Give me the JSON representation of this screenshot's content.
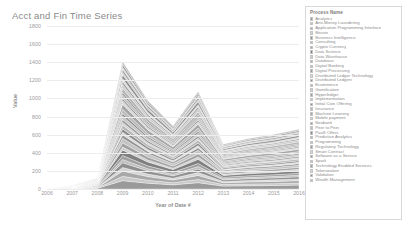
{
  "chart_data": {
    "type": "area",
    "title": "Acct and Fin Time Series",
    "xlabel": "Year of Date #",
    "ylabel": "Value",
    "ylim": [
      0,
      1800
    ],
    "yticks": [
      0,
      200,
      400,
      600,
      800,
      1000,
      1200,
      1400,
      1600,
      1800
    ],
    "ytick_labels": [
      "0",
      "200",
      "400",
      "600",
      "800",
      "1000",
      "1200",
      "1400",
      "1600",
      "1800"
    ],
    "grid": true,
    "legend_position": "right",
    "legend_title": "Process Name",
    "stacked": true,
    "x": [
      2006,
      2007,
      2008,
      2009,
      2010,
      2011,
      2012,
      2013,
      2014,
      2015,
      2016
    ],
    "xtick_labels": [
      "2006",
      "2007",
      "2008",
      "2009",
      "2010",
      "2011",
      "2012",
      "2013",
      "2014",
      "2015",
      "2016"
    ],
    "totals": [
      5,
      40,
      150,
      1790,
      1240,
      880,
      1360,
      620,
      700,
      760,
      840
    ],
    "series": [
      {
        "name": "Analytics",
        "color": "#9a9a9a",
        "values": [
          0,
          2,
          8,
          92,
          64,
          46,
          70,
          32,
          36,
          39,
          43
        ]
      },
      {
        "name": "Anti-Money Laundering",
        "color": "#c9c9c9",
        "values": [
          0,
          1,
          4,
          48,
          33,
          24,
          36,
          17,
          19,
          20,
          22
        ]
      },
      {
        "name": "Application Programming Interface",
        "color": "#a8a8a8",
        "values": [
          0,
          1,
          5,
          58,
          40,
          29,
          44,
          20,
          23,
          25,
          27
        ]
      },
      {
        "name": "Bitcoin",
        "color": "#d4d4d4",
        "values": [
          0,
          1,
          3,
          40,
          28,
          20,
          31,
          14,
          16,
          17,
          19
        ]
      },
      {
        "name": "Business Intelligence",
        "color": "#8f8f8f",
        "values": [
          0,
          1,
          4,
          52,
          36,
          26,
          40,
          18,
          20,
          22,
          24
        ]
      },
      {
        "name": "Consulting",
        "color": "#bdbdbd",
        "values": [
          0,
          1,
          3,
          35,
          24,
          17,
          27,
          12,
          14,
          15,
          17
        ]
      },
      {
        "name": "Crypto Currency",
        "color": "#9f9f9f",
        "values": [
          0,
          1,
          4,
          45,
          31,
          22,
          34,
          16,
          18,
          19,
          21
        ]
      },
      {
        "name": "Data Science",
        "color": "#7f7f7f",
        "values": [
          0,
          1,
          5,
          60,
          42,
          30,
          46,
          21,
          24,
          26,
          28
        ]
      },
      {
        "name": "Data Warehouse",
        "color": "#cfcfcf",
        "values": [
          0,
          1,
          3,
          33,
          23,
          16,
          25,
          12,
          13,
          14,
          16
        ]
      },
      {
        "name": "Database",
        "color": "#a2a2a2",
        "values": [
          0,
          1,
          4,
          47,
          33,
          23,
          36,
          16,
          19,
          20,
          22
        ]
      },
      {
        "name": "Digital Banking",
        "color": "#c3c3c3",
        "values": [
          0,
          1,
          4,
          50,
          35,
          25,
          38,
          17,
          20,
          21,
          23
        ]
      },
      {
        "name": "Digital Processing",
        "color": "#959595",
        "values": [
          0,
          1,
          3,
          38,
          26,
          19,
          29,
          13,
          15,
          16,
          18
        ]
      },
      {
        "name": "Distributed Ledger Technology",
        "color": "#dcdcdc",
        "values": [
          0,
          1,
          3,
          30,
          21,
          15,
          23,
          11,
          12,
          13,
          15
        ]
      },
      {
        "name": "Distributed Ledgers",
        "color": "#8a8a8a",
        "values": [
          0,
          1,
          3,
          36,
          25,
          18,
          28,
          13,
          14,
          15,
          17
        ]
      },
      {
        "name": "Ecommerce",
        "color": "#b8b8b8",
        "values": [
          0,
          1,
          4,
          43,
          30,
          21,
          33,
          15,
          17,
          18,
          20
        ]
      },
      {
        "name": "Gamification",
        "color": "#d0d0d0",
        "values": [
          0,
          1,
          2,
          27,
          19,
          13,
          21,
          9,
          11,
          12,
          13
        ]
      },
      {
        "name": "Hyperledger",
        "color": "#9c9c9c",
        "values": [
          0,
          1,
          3,
          34,
          24,
          17,
          26,
          12,
          14,
          15,
          16
        ]
      },
      {
        "name": "Implementation",
        "color": "#c6c6c6",
        "values": [
          0,
          1,
          3,
          39,
          27,
          19,
          30,
          14,
          15,
          17,
          18
        ]
      },
      {
        "name": "Initial Coin Offering",
        "color": "#878787",
        "values": [
          0,
          1,
          2,
          28,
          19,
          14,
          21,
          10,
          11,
          12,
          13
        ]
      },
      {
        "name": "Insurance",
        "color": "#bbbbbb",
        "values": [
          0,
          1,
          4,
          46,
          32,
          23,
          35,
          16,
          18,
          20,
          21
        ]
      },
      {
        "name": "Machine Learning",
        "color": "#a5a5a5",
        "values": [
          0,
          1,
          5,
          56,
          39,
          28,
          43,
          20,
          22,
          24,
          26
        ]
      },
      {
        "name": "Mobile payment",
        "color": "#d7d7d7",
        "values": [
          0,
          1,
          3,
          37,
          26,
          18,
          28,
          13,
          15,
          16,
          17
        ]
      },
      {
        "name": "Neobank",
        "color": "#929292",
        "values": [
          0,
          1,
          2,
          26,
          18,
          13,
          20,
          9,
          10,
          11,
          12
        ]
      },
      {
        "name": "Peer to Peer",
        "color": "#c1c1c1",
        "values": [
          0,
          1,
          3,
          41,
          28,
          20,
          31,
          14,
          16,
          17,
          19
        ]
      },
      {
        "name": "PaaS Offers",
        "color": "#848484",
        "values": [
          0,
          1,
          2,
          24,
          17,
          12,
          19,
          9,
          10,
          10,
          11
        ]
      },
      {
        "name": "Predictive Analytics",
        "color": "#b5b5b5",
        "values": [
          0,
          1,
          4,
          49,
          34,
          24,
          37,
          17,
          19,
          21,
          23
        ]
      },
      {
        "name": "Programming",
        "color": "#cccccc",
        "values": [
          0,
          1,
          3,
          42,
          29,
          21,
          32,
          15,
          17,
          18,
          20
        ]
      },
      {
        "name": "Regulatory Technology",
        "color": "#999999",
        "values": [
          0,
          1,
          3,
          31,
          22,
          15,
          24,
          11,
          12,
          13,
          15
        ]
      },
      {
        "name": "Smart Contract",
        "color": "#dadada",
        "values": [
          0,
          1,
          3,
          32,
          22,
          16,
          24,
          11,
          13,
          14,
          15
        ]
      },
      {
        "name": "Software as a Service",
        "color": "#8d8d8d",
        "values": [
          0,
          1,
          4,
          44,
          31,
          22,
          34,
          15,
          17,
          19,
          20
        ]
      },
      {
        "name": "Spark",
        "color": "#c7c7c7",
        "values": [
          0,
          1,
          2,
          25,
          17,
          12,
          19,
          9,
          10,
          11,
          12
        ]
      },
      {
        "name": "Technology Enabled Services",
        "color": "#a0a0a0",
        "values": [
          0,
          1,
          3,
          35,
          24,
          17,
          27,
          12,
          14,
          15,
          16
        ]
      },
      {
        "name": "Tokenization",
        "color": "#d2d2d2",
        "values": [
          0,
          1,
          2,
          23,
          16,
          11,
          18,
          8,
          9,
          10,
          11
        ]
      },
      {
        "name": "Validation",
        "color": "#8b8b8b",
        "values": [
          0,
          1,
          3,
          29,
          20,
          14,
          22,
          10,
          12,
          12,
          14
        ]
      },
      {
        "name": "Wealth Management",
        "color": "#bebebe",
        "values": [
          0,
          1,
          3,
          34,
          23,
          17,
          26,
          12,
          13,
          14,
          16
        ]
      }
    ]
  },
  "legend": {
    "title": "Process Name"
  }
}
